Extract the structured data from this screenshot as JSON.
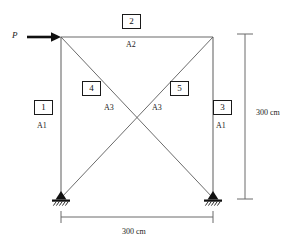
{
  "diagram": {
    "units": "cm",
    "load": {
      "symbol": "P",
      "direction": "right"
    },
    "members": [
      {
        "id": "1",
        "box_label": "1",
        "area_label": "A1",
        "kind": "left-column"
      },
      {
        "id": "2",
        "box_label": "2",
        "area_label": "A2",
        "kind": "top-chord"
      },
      {
        "id": "3",
        "box_label": "3",
        "area_label": "A1",
        "kind": "right-column"
      },
      {
        "id": "4",
        "box_label": "4",
        "area_label": "A3",
        "kind": "diagonal-tl-br"
      },
      {
        "id": "5",
        "box_label": "5",
        "area_label": "A3",
        "kind": "diagonal-bl-tr"
      }
    ],
    "dimensions": {
      "vertical": "300 cm",
      "horizontal": "300 cm"
    },
    "supports": {
      "left": "pinned-support",
      "right": "pinned-support"
    },
    "colors": {
      "line": "#5a5a5a",
      "ink": "#1a1a1a",
      "background": "#ffffff"
    }
  }
}
